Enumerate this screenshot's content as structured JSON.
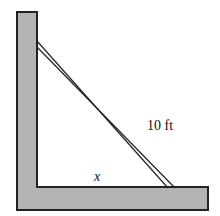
{
  "diagram": {
    "ladder_label": "10 ft",
    "base_label": "x",
    "colors": {
      "wall_fill": "#b3b3b3",
      "outline": "#222222",
      "background": "#ffffff"
    }
  }
}
